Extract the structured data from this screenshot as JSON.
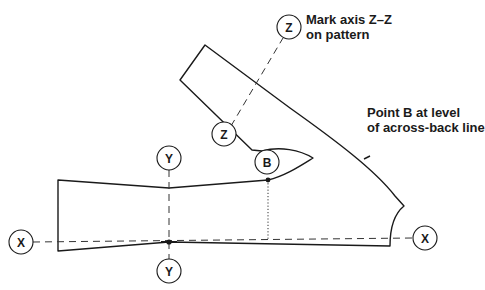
{
  "diagram": {
    "type": "sewing-pattern-sleeve",
    "annotations": {
      "axis_note_line1": "Mark axis Z–Z",
      "axis_note_line2": "on pattern",
      "point_b_note_line1": "Point B at level",
      "point_b_note_line2": "of across-back line"
    },
    "markers": {
      "x_left": "X",
      "x_right": "X",
      "y_top": "Y",
      "y_bottom": "Y",
      "z_top": "Z",
      "z_bottom": "Z",
      "b": "B"
    },
    "colors": {
      "line": "#1a1a1a",
      "background": "#ffffff"
    }
  }
}
